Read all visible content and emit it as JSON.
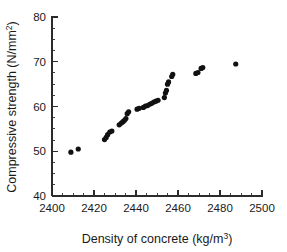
{
  "chart_data": {
    "type": "scatter",
    "title": "",
    "xlabel": "Density of concrete (kg/m3)",
    "xlabel_base": "Density of concrete (kg/m",
    "xlabel_sup": "3",
    "xlabel_tail": ")",
    "ylabel": "Compressive strength (N/mm2)",
    "ylabel_base": "Compressive strength (N/mm",
    "ylabel_sup": "2",
    "ylabel_tail": ")",
    "xlim": [
      2400,
      2500
    ],
    "ylim": [
      40,
      80
    ],
    "xticks": [
      2400,
      2420,
      2440,
      2460,
      2480,
      2500
    ],
    "xtick_labels": [
      "2400",
      "2420",
      "2440",
      "2460",
      "2480",
      "2500"
    ],
    "yticks": [
      40,
      50,
      60,
      70,
      80
    ],
    "ytick_labels": [
      "40",
      "50",
      "60",
      "70",
      "80"
    ],
    "x_minor_step": 5,
    "y_minor_step": 2.5,
    "grid": false,
    "legend": null,
    "marker": "filled-circle",
    "marker_color": "#111111",
    "marker_size_px": 5.2,
    "points": [
      {
        "x": 2409.0,
        "y": 49.8
      },
      {
        "x": 2412.5,
        "y": 50.5
      },
      {
        "x": 2425.0,
        "y": 52.6
      },
      {
        "x": 2425.8,
        "y": 53.1
      },
      {
        "x": 2426.5,
        "y": 53.7
      },
      {
        "x": 2427.5,
        "y": 54.3
      },
      {
        "x": 2428.5,
        "y": 54.5
      },
      {
        "x": 2432.0,
        "y": 55.9
      },
      {
        "x": 2433.0,
        "y": 56.3
      },
      {
        "x": 2433.8,
        "y": 56.6
      },
      {
        "x": 2434.5,
        "y": 56.9
      },
      {
        "x": 2435.2,
        "y": 57.3
      },
      {
        "x": 2435.8,
        "y": 58.4
      },
      {
        "x": 2436.5,
        "y": 58.8
      },
      {
        "x": 2440.5,
        "y": 59.4
      },
      {
        "x": 2441.5,
        "y": 59.6
      },
      {
        "x": 2443.5,
        "y": 59.8
      },
      {
        "x": 2444.5,
        "y": 60.1
      },
      {
        "x": 2445.5,
        "y": 60.2
      },
      {
        "x": 2446.5,
        "y": 60.5
      },
      {
        "x": 2447.5,
        "y": 60.7
      },
      {
        "x": 2448.5,
        "y": 61.0
      },
      {
        "x": 2449.5,
        "y": 61.2
      },
      {
        "x": 2450.5,
        "y": 61.4
      },
      {
        "x": 2453.5,
        "y": 62.0
      },
      {
        "x": 2454.0,
        "y": 63.0
      },
      {
        "x": 2454.5,
        "y": 63.6
      },
      {
        "x": 2455.0,
        "y": 65.0
      },
      {
        "x": 2455.5,
        "y": 65.5
      },
      {
        "x": 2457.0,
        "y": 66.7
      },
      {
        "x": 2457.5,
        "y": 67.2
      },
      {
        "x": 2468.5,
        "y": 67.4
      },
      {
        "x": 2469.5,
        "y": 67.6
      },
      {
        "x": 2471.0,
        "y": 68.5
      },
      {
        "x": 2471.8,
        "y": 68.7
      },
      {
        "x": 2487.5,
        "y": 69.5
      }
    ]
  }
}
